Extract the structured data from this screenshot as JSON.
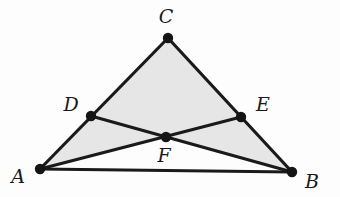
{
  "figure": {
    "background_color": "#fdfdfd",
    "stroke_color": "#1a1a1a",
    "fill_color": "#e6e6e6",
    "dot_color": "#141414",
    "stroke_width": 3.2,
    "dot_radius": 5.2,
    "label_font_size": 19
  },
  "points": [
    {
      "id": "A",
      "label": "A",
      "x": 40,
      "y": 169,
      "label_x": 18,
      "label_y": 176
    },
    {
      "id": "B",
      "label": "B",
      "x": 292,
      "y": 172,
      "label_x": 312,
      "label_y": 181
    },
    {
      "id": "C",
      "label": "C",
      "x": 168,
      "y": 38,
      "label_x": 166,
      "label_y": 16
    },
    {
      "id": "D",
      "label": "D",
      "x": 91,
      "y": 116,
      "label_x": 71,
      "label_y": 104
    },
    {
      "id": "E",
      "label": "E",
      "x": 241,
      "y": 117,
      "label_x": 263,
      "label_y": 104
    },
    {
      "id": "F",
      "label": "F",
      "x": 166,
      "y": 137,
      "label_x": 164,
      "label_y": 155
    }
  ],
  "shaded_regions": [
    {
      "id": "DCEF",
      "name": "upper-quadrilateral",
      "polygon": "91,116 168,38 241,117 166,137"
    },
    {
      "id": "ADF",
      "name": "left-triangle",
      "polygon": "40,169 91,116 166,137"
    },
    {
      "id": "FEB",
      "name": "right-triangle",
      "polygon": "166,137 241,117 292,172"
    }
  ],
  "segments": [
    {
      "id": "AC",
      "name": "segment-a-c",
      "x1": 40,
      "y1": 169,
      "x2": 168,
      "y2": 38
    },
    {
      "id": "BC",
      "name": "segment-b-c",
      "x1": 292,
      "y1": 172,
      "x2": 168,
      "y2": 38
    },
    {
      "id": "AB",
      "name": "segment-a-b",
      "x1": 40,
      "y1": 169,
      "x2": 292,
      "y2": 172
    },
    {
      "id": "DB",
      "name": "segment-d-b",
      "x1": 91,
      "y1": 116,
      "x2": 292,
      "y2": 172
    },
    {
      "id": "EA",
      "name": "segment-e-a",
      "x1": 241,
      "y1": 117,
      "x2": 40,
      "y2": 169
    }
  ]
}
